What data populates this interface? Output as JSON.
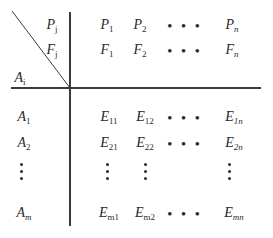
{
  "corner": {
    "row_top": "P",
    "row_top_sub": "j",
    "row_mid": "F",
    "row_mid_sub": "j",
    "col": "A",
    "col_sub": "i"
  },
  "header": {
    "p": [
      {
        "b": "P",
        "s": "1"
      },
      {
        "b": "P",
        "s": "2"
      },
      {
        "b": "P",
        "s": "n"
      }
    ],
    "f": [
      {
        "b": "F",
        "s": "1"
      },
      {
        "b": "F",
        "s": "2"
      },
      {
        "b": "F",
        "s": "n"
      }
    ]
  },
  "rows": {
    "labels": [
      {
        "b": "A",
        "s": "1"
      },
      {
        "b": "A",
        "s": "2"
      },
      {
        "b": "A",
        "s": "m"
      }
    ],
    "r1": [
      {
        "b": "E",
        "s": "11"
      },
      {
        "b": "E",
        "s": "12"
      },
      {
        "b": "E",
        "s": "1n"
      }
    ],
    "r2": [
      {
        "b": "E",
        "s": "21"
      },
      {
        "b": "E",
        "s": "22"
      },
      {
        "b": "E",
        "s": "2n"
      }
    ],
    "rm": [
      {
        "b": "E",
        "s": "m1"
      },
      {
        "b": "E",
        "s": "m2"
      },
      {
        "b": "E",
        "s": "mn"
      }
    ]
  },
  "ellipsis": "• • •"
}
